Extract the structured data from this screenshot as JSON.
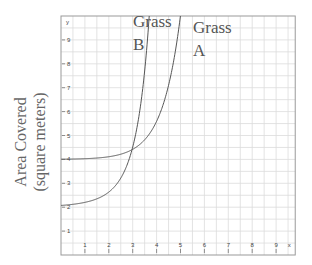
{
  "chart_data": {
    "type": "line",
    "title": "",
    "xlabel": "",
    "ylabel": "Area Covered (square meters)",
    "ylabel_lines": [
      "Area Covered",
      "(square meters)"
    ],
    "axis_letters": {
      "x": "x",
      "y": "y"
    },
    "xlim": [
      0,
      9.8
    ],
    "ylim": [
      0,
      10
    ],
    "x_ticks": [
      "1",
      "2",
      "3",
      "4",
      "5",
      "6",
      "7",
      "8",
      "9"
    ],
    "y_ticks": [
      "1",
      "2",
      "3",
      "4",
      "5",
      "6",
      "7",
      "8",
      "9"
    ],
    "grid": true,
    "grid_step": 0.5,
    "series": [
      {
        "name": "Grass A",
        "label_lines": [
          "Grass",
          "A"
        ],
        "points": [
          [
            0,
            4.1
          ],
          [
            1,
            4.15
          ],
          [
            2,
            4.3
          ],
          [
            3,
            4.6
          ],
          [
            3.5,
            5.0
          ],
          [
            4,
            5.9
          ],
          [
            4.5,
            7.2
          ],
          [
            5,
            9.2
          ],
          [
            5.2,
            10
          ]
        ]
      },
      {
        "name": "Grass B",
        "label_lines": [
          "Grass",
          "B"
        ],
        "points": [
          [
            0,
            2.0
          ],
          [
            1,
            2.1
          ],
          [
            2,
            2.5
          ],
          [
            2.5,
            2.9
          ],
          [
            3,
            3.5
          ],
          [
            3.5,
            4.5
          ],
          [
            4,
            6.0
          ],
          [
            4.3,
            8.0
          ],
          [
            4.5,
            10
          ]
        ]
      }
    ],
    "intersection": [
      4,
      6
    ]
  }
}
